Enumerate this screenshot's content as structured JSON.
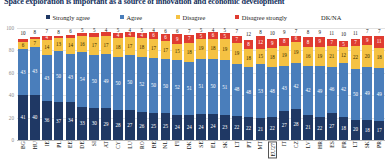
{
  "title": "Space exploration is important as a source of innovation and economic development",
  "legend": {
    "position": "top",
    "items": [
      {
        "label": "Strongly agree",
        "color": "#1f3864",
        "key": "strongly_agree"
      },
      {
        "label": "Agree",
        "color": "#4a7ebb",
        "key": "agree"
      },
      {
        "label": "Disagree",
        "color": "#f5c243",
        "key": "disagree"
      },
      {
        "label": "Disagree strongly",
        "color": "#e03c31",
        "key": "disagree_strongly"
      },
      {
        "label": "DK/NA",
        "color": "#f2f2f2",
        "key": "dk_na"
      }
    ]
  },
  "yaxis": {
    "ticks": [
      "100",
      "80",
      "60",
      "40",
      "20",
      "0"
    ],
    "range": [
      0,
      100
    ]
  },
  "highlight": "EU27",
  "chart_data": {
    "type": "bar",
    "title": "Space exploration is important as a source of innovation and economic development",
    "xlabel": "",
    "ylabel": "",
    "ylim": [
      0,
      100
    ],
    "grid": true,
    "stacked": true,
    "legend_position": "top",
    "categories": [
      "BG",
      "HU",
      "IE",
      "PL",
      "EE",
      "DE",
      "SI",
      "AT",
      "CY",
      "LU",
      "RO",
      "BE",
      "NL",
      "FI",
      "DK",
      "SE",
      "EL",
      "SK",
      "LT",
      "PT",
      "MT",
      "EU27",
      "IT",
      "CZ",
      "LV",
      "HR",
      "ES",
      "FR",
      "LT",
      "SK",
      "PR"
    ],
    "series": [
      {
        "name": "Strongly agree",
        "color": "#1f3864",
        "values": [
          41,
          40,
          36,
          37,
          34,
          33,
          30,
          29,
          28,
          27,
          26,
          25,
          25,
          24,
          24,
          24,
          24,
          23,
          22,
          22,
          21,
          22,
          27,
          28,
          21,
          22,
          27,
          18,
          20,
          18,
          17
        ]
      },
      {
        "name": "Agree",
        "color": "#4a7ebb",
        "values": [
          43,
          43,
          43,
          50,
          43,
          54,
          50,
          49,
          50,
          50,
          52,
          50,
          50,
          52,
          51,
          51,
          50,
          51,
          48,
          48,
          53,
          48,
          43,
          42,
          42,
          49,
          46,
          42,
          50,
          49,
          49
        ]
      },
      {
        "name": "Disagree",
        "color": "#f5c243",
        "values": [
          6,
          7,
          14,
          13,
          14,
          16,
          17,
          17,
          18,
          17,
          18,
          17,
          17,
          15,
          18,
          19,
          18,
          19,
          19,
          18,
          15,
          18,
          19,
          19,
          16,
          19,
          21,
          12,
          22,
          20,
          18
        ]
      },
      {
        "name": "Disagree strongly",
        "color": "#e03c31",
        "values": [
          3,
          2,
          4,
          2,
          3,
          3,
          3,
          3,
          4,
          4,
          4,
          6,
          6,
          9,
          7,
          5,
          6,
          5,
          7,
          8,
          12,
          9,
          8,
          6,
          8,
          9,
          7,
          5,
          7,
          9,
          11
        ]
      },
      {
        "name": "DK/NA",
        "color": "#f2f2f2",
        "values": [
          10,
          8,
          7,
          8,
          6,
          5,
          5,
          4,
          5,
          4,
          5,
          4,
          6,
          6,
          7,
          5,
          4,
          5,
          7,
          12,
          8,
          10,
          9,
          7,
          8,
          9,
          11,
          10,
          11,
          7,
          7
        ]
      }
    ]
  }
}
